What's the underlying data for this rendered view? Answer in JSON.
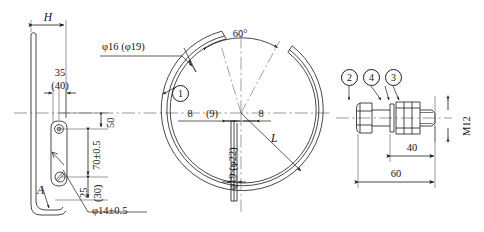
{
  "drawing": {
    "title": "Clamp ring assembly engineering drawing",
    "sheet_size": {
      "width": 484,
      "height": 232
    },
    "line_color": "#1a1a1a",
    "center_line_color": "#6f6f6f",
    "background": "#ffffff"
  },
  "views": {
    "side_view": {
      "name": "side-view-hook",
      "dimensions": [
        {
          "id": "H",
          "text": "H"
        },
        {
          "id": "d35",
          "text": "35"
        },
        {
          "id": "d40",
          "text": "(40)"
        },
        {
          "id": "d50",
          "text": "50"
        },
        {
          "id": "d70",
          "text": "70±0.5"
        },
        {
          "id": "d25",
          "text": "25"
        },
        {
          "id": "d30",
          "text": "(30)"
        },
        {
          "id": "dia14",
          "text": "φ14±0.5"
        },
        {
          "id": "bendA",
          "text": "A"
        }
      ]
    },
    "front_view": {
      "name": "front-view-split-ring",
      "dimensions": [
        {
          "id": "dia16",
          "text": "φ16  (φ19)"
        },
        {
          "id": "angle60",
          "text": "60°"
        },
        {
          "id": "left8",
          "text": "8"
        },
        {
          "id": "paren9",
          "text": "(9)"
        },
        {
          "id": "right8",
          "text": "8"
        },
        {
          "id": "radiusL",
          "text": "L"
        },
        {
          "id": "dia19",
          "text": "φ19  (φ22)"
        }
      ],
      "balloons": [
        {
          "id": "balloon-1",
          "text": "1"
        }
      ]
    },
    "bolt_detail": {
      "name": "bolt-assembly-detail",
      "dimensions": [
        {
          "id": "len40",
          "text": "40"
        },
        {
          "id": "len60",
          "text": "60"
        },
        {
          "id": "threadM",
          "text": "M12"
        }
      ],
      "balloons": [
        {
          "id": "balloon-2",
          "text": "2"
        },
        {
          "id": "balloon-4",
          "text": "4"
        },
        {
          "id": "balloon-3",
          "text": "3"
        }
      ]
    }
  }
}
